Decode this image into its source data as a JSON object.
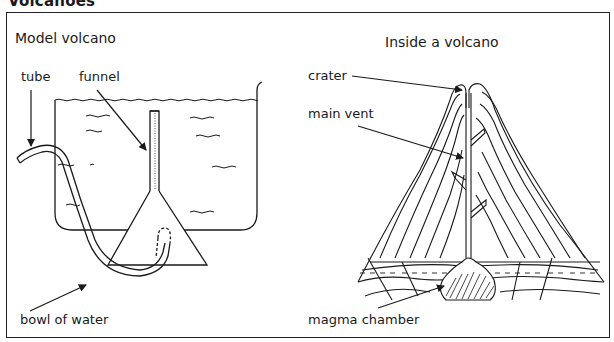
{
  "title": "Volcanoes",
  "panels": {
    "model": {
      "heading": "Model volcano",
      "labels": {
        "tube": "tube",
        "funnel": "funnel",
        "bowl": "bowl of water"
      }
    },
    "inside": {
      "heading": "Inside a volcano",
      "labels": {
        "crater": "crater",
        "main_vent": "main vent",
        "magma_chamber": "magma chamber"
      }
    }
  },
  "colors": {
    "line": "#1a1a1a",
    "background": "#ffffff",
    "frame": "#222222"
  }
}
